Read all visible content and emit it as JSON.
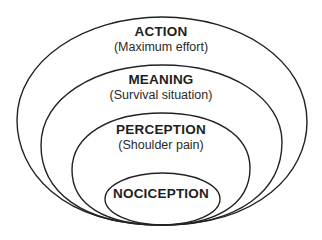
{
  "diagram": {
    "layers": [
      {
        "title": "ACTION",
        "subtitle": "(Maximum effort)"
      },
      {
        "title": "MEANING",
        "subtitle": "(Survival situation)"
      },
      {
        "title": "PERCEPTION",
        "subtitle": "(Shoulder pain)"
      },
      {
        "title": "NOCICEPTION",
        "subtitle": ""
      }
    ],
    "stroke_color": "#222222"
  }
}
